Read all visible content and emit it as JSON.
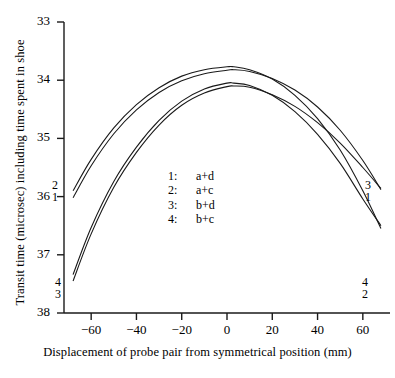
{
  "chart_data": {
    "type": "line",
    "title": "",
    "xlabel": "Displacement of probe pair from symmetrical position (mm)",
    "ylabel": "Transit time (microsec) including time spent in shoe",
    "xlim": [
      -72,
      72
    ],
    "ylim": [
      38,
      33
    ],
    "y_axis_inverted": true,
    "grid": false,
    "legend_position": "center",
    "xticks": [
      -60,
      -40,
      -20,
      0,
      20,
      40,
      60
    ],
    "xtick_labels": [
      "−60",
      "−40",
      "−20",
      "0",
      "20",
      "40",
      "60"
    ],
    "yticks": [
      33,
      34,
      35,
      36,
      37,
      38
    ],
    "ytick_labels": [
      "33",
      "34",
      "35",
      "36",
      "37",
      "38"
    ],
    "series": [
      {
        "name": "1",
        "legend_label": "a+d",
        "x": [
          -68,
          -60,
          -50,
          -40,
          -30,
          -20,
          -10,
          0,
          3,
          10,
          20,
          30,
          40,
          50,
          60,
          68
        ],
        "values": [
          36.02,
          35.47,
          34.92,
          34.51,
          34.21,
          34.01,
          33.89,
          33.83,
          33.82,
          33.85,
          33.97,
          34.17,
          34.46,
          34.86,
          35.38,
          35.88
        ]
      },
      {
        "name": "2",
        "legend_label": "a+c",
        "x": [
          -68,
          -60,
          -50,
          -40,
          -30,
          -20,
          -10,
          0,
          3,
          10,
          20,
          30,
          40,
          50,
          60,
          68
        ],
        "values": [
          35.9,
          35.36,
          34.82,
          34.42,
          34.13,
          33.93,
          33.82,
          33.77,
          33.77,
          33.82,
          33.98,
          34.26,
          34.66,
          35.2,
          35.9,
          36.55
        ]
      },
      {
        "name": "3",
        "legend_label": "b+d",
        "x": [
          -68,
          -60,
          -50,
          -40,
          -30,
          -20,
          -10,
          0,
          3,
          10,
          20,
          30,
          40,
          50,
          60,
          68
        ],
        "values": [
          37.45,
          36.64,
          35.84,
          35.24,
          34.77,
          34.43,
          34.22,
          34.11,
          34.1,
          34.12,
          34.25,
          34.45,
          34.73,
          35.08,
          35.5,
          35.86
        ]
      },
      {
        "name": "4",
        "legend_label": "b+c",
        "x": [
          -68,
          -60,
          -50,
          -40,
          -30,
          -20,
          -10,
          0,
          3,
          10,
          20,
          30,
          40,
          50,
          60,
          68
        ],
        "values": [
          37.34,
          36.53,
          35.74,
          35.15,
          34.69,
          34.36,
          34.15,
          34.05,
          34.05,
          34.09,
          34.26,
          34.54,
          34.93,
          35.43,
          36.04,
          36.5
        ]
      }
    ],
    "legend": [
      {
        "key": "1:",
        "label": "a+d"
      },
      {
        "key": "2:",
        "label": "a+c"
      },
      {
        "key": "3:",
        "label": "b+d"
      },
      {
        "key": "4:",
        "label": "b+c"
      }
    ],
    "endpoint_labels": {
      "left_upper": [
        "2",
        "1"
      ],
      "left_lower": [
        "4",
        "3"
      ],
      "right_upper": [
        "3",
        "1"
      ],
      "right_lower": [
        "4",
        "2"
      ]
    },
    "line_color": "#1a1a1a",
    "axis_color": "#1a1a1a"
  }
}
